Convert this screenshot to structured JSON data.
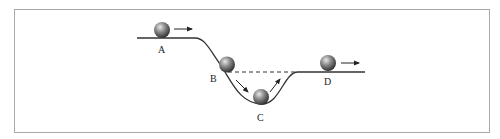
{
  "diagram": {
    "type": "physics-track",
    "colors": {
      "frame": "#a9a9a9",
      "track": "#333333",
      "dashed": "#333333",
      "ball_light": "#d9d9d9",
      "ball_dark": "#3a3a3a",
      "arrow": "#222222"
    },
    "points": [
      {
        "id": "A",
        "label": "A"
      },
      {
        "id": "B",
        "label": "B"
      },
      {
        "id": "C",
        "label": "C"
      },
      {
        "id": "D",
        "label": "D"
      }
    ],
    "annotations": {
      "dashed_line": "horizontal reference from B to D level",
      "arrows": [
        "A: right",
        "B: down-slope",
        "C: up-slope",
        "D: right"
      ]
    }
  }
}
